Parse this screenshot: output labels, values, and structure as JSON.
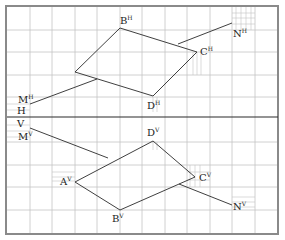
{
  "diagram": {
    "type": "descriptive-geometry-projection",
    "axis": {
      "upper_label": "H",
      "lower_label": "V"
    },
    "colors": {
      "grid": "#bdbdbd",
      "frame": "#8a8a8a",
      "lines": "#2a2a2a",
      "background": "#ffffff"
    },
    "labels": {
      "BH": {
        "base": "B",
        "sup": "H"
      },
      "CH": {
        "base": "C",
        "sup": "H"
      },
      "DH": {
        "base": "D",
        "sup": "H"
      },
      "MH": {
        "base": "M",
        "sup": "H"
      },
      "NH": {
        "base": "N",
        "sup": "H"
      },
      "DV": {
        "base": "D",
        "sup": "V"
      },
      "MV": {
        "base": "M",
        "sup": "V"
      },
      "AV": {
        "base": "A",
        "sup": "V"
      },
      "CV": {
        "base": "C",
        "sup": "V"
      },
      "BV": {
        "base": "B",
        "sup": "V"
      },
      "NV": {
        "base": "N",
        "sup": "V"
      }
    },
    "horizontal_projection": {
      "quadrilateral": [
        "A^H",
        "B^H",
        "C^H",
        "D^H"
      ],
      "line": [
        "M^H",
        "N^H"
      ]
    },
    "vertical_projection": {
      "quadrilateral": [
        "A^V",
        "D^V",
        "C^V",
        "B^V"
      ],
      "line": [
        "M^V",
        "N^V"
      ]
    }
  }
}
